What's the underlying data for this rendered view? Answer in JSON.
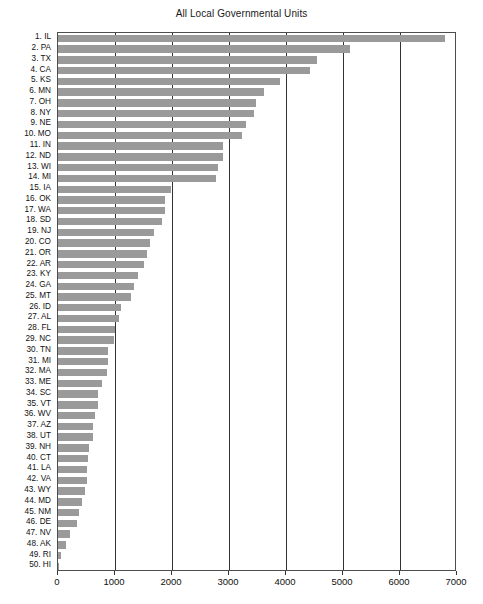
{
  "chart_data": {
    "type": "bar",
    "orientation": "horizontal",
    "title": "All Local Governmental Units",
    "xlabel": "",
    "ylabel": "State",
    "xlim": [
      0,
      7000
    ],
    "xticks": [
      0,
      1000,
      2000,
      3000,
      4000,
      5000,
      6000,
      7000
    ],
    "grid": true,
    "legend": "none",
    "bar_color": "#9a9a9a",
    "categories": [
      "1. IL",
      "2. PA",
      "3. TX",
      "4. CA",
      "5. KS",
      "6. MN",
      "7. OH",
      "8. NY",
      "9. NE",
      "10. MO",
      "11. IN",
      "12. ND",
      "13. WI",
      "14. MI",
      "15. IA",
      "16. OK",
      "17. WA",
      "18. SD",
      "19. NJ",
      "20. CO",
      "21. OR",
      "22. AR",
      "23. KY",
      "24. GA",
      "25. MT",
      "26. ID",
      "27. AL",
      "28. FL",
      "29. NC",
      "30. TN",
      "31. MI",
      "32. MA",
      "33. ME",
      "34. SC",
      "35. VT",
      "36. WV",
      "37. AZ",
      "38. UT",
      "39. NH",
      "40. CT",
      "41. LA",
      "42. VA",
      "43. WY",
      "44. MD",
      "45. NM",
      "46. DE",
      "47. NV",
      "48. AK",
      "49. RI",
      "50. HI"
    ],
    "values": [
      6790,
      5120,
      4550,
      4420,
      3900,
      3620,
      3480,
      3440,
      3290,
      3220,
      2900,
      2890,
      2800,
      2780,
      1990,
      1880,
      1870,
      1830,
      1680,
      1620,
      1560,
      1510,
      1400,
      1340,
      1280,
      1105,
      1070,
      1000,
      980,
      880,
      880,
      855,
      770,
      700,
      700,
      650,
      615,
      615,
      545,
      530,
      510,
      505,
      475,
      425,
      365,
      335,
      210,
      145,
      55,
      20
    ]
  }
}
